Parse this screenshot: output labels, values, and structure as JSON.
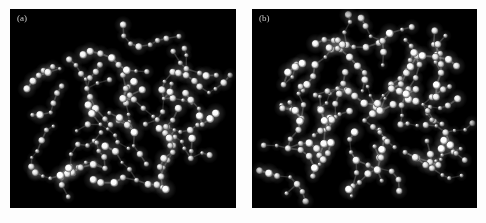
{
  "figure": {
    "type": "molecular-snapshot-pair",
    "background_color": "#fdfdfd",
    "panel_background_color": "#000000",
    "atom_color": "#ffffff",
    "bond_color": "#6a6a6a",
    "label_color": "#c9c9c9",
    "panels": [
      {
        "id": "a",
        "label": "(a)",
        "description": "branched chain molecular configuration snapshot",
        "atom_count": 156,
        "seed": 1337,
        "cluster_centers": [
          [
            0.18,
            0.52
          ],
          [
            0.3,
            0.68
          ],
          [
            0.42,
            0.8
          ],
          [
            0.55,
            0.62
          ],
          [
            0.68,
            0.45
          ],
          [
            0.78,
            0.3
          ],
          [
            0.62,
            0.18
          ],
          [
            0.48,
            0.28
          ],
          [
            0.34,
            0.4
          ],
          [
            0.22,
            0.3
          ],
          [
            0.85,
            0.58
          ],
          [
            0.72,
            0.72
          ],
          [
            0.56,
            0.86
          ],
          [
            0.4,
            0.58
          ],
          [
            0.26,
            0.8
          ],
          [
            0.88,
            0.42
          ],
          [
            0.5,
            0.45
          ],
          [
            0.66,
            0.6
          ],
          [
            0.8,
            0.75
          ],
          [
            0.14,
            0.66
          ]
        ]
      },
      {
        "id": "b",
        "label": "(b)",
        "description": "branched chain molecular configuration snapshot, more dispersed",
        "atom_count": 168,
        "seed": 24601,
        "cluster_centers": [
          [
            0.14,
            0.38
          ],
          [
            0.22,
            0.55
          ],
          [
            0.16,
            0.7
          ],
          [
            0.3,
            0.78
          ],
          [
            0.44,
            0.72
          ],
          [
            0.56,
            0.8
          ],
          [
            0.68,
            0.72
          ],
          [
            0.8,
            0.8
          ],
          [
            0.86,
            0.62
          ],
          [
            0.76,
            0.48
          ],
          [
            0.62,
            0.4
          ],
          [
            0.5,
            0.32
          ],
          [
            0.38,
            0.4
          ],
          [
            0.28,
            0.28
          ],
          [
            0.42,
            0.18
          ],
          [
            0.58,
            0.16
          ],
          [
            0.72,
            0.22
          ],
          [
            0.84,
            0.32
          ],
          [
            0.2,
            0.88
          ],
          [
            0.5,
            0.56
          ],
          [
            0.66,
            0.58
          ],
          [
            0.34,
            0.6
          ]
        ]
      }
    ]
  },
  "chart_data": {
    "type": "scatter",
    "title": "",
    "xlabel": "",
    "ylabel": "",
    "legend": [],
    "annotations": [
      "(a)",
      "(b)"
    ],
    "grid": false
  }
}
